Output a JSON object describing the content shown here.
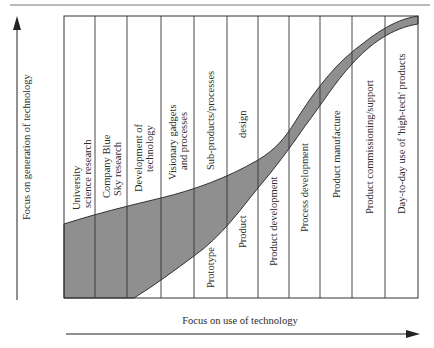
{
  "diagram": {
    "type": "technology-focus-band",
    "y_axis_label": "Focus on generation of technology",
    "x_axis_label": "Focus on use of technology",
    "band_color": "#8f8f8f",
    "frame_color": "#333333",
    "columns": [
      {
        "lines": [
          "University",
          "science research"
        ]
      },
      {
        "lines": [
          "Company Blue",
          "Sky research"
        ]
      },
      {
        "lines": [
          "Development of",
          "technology"
        ]
      },
      {
        "lines": [
          "Visionary gadgets",
          "and processes"
        ]
      },
      {
        "lines": [
          "Sub-products/processes"
        ]
      },
      {
        "lines": [
          "design"
        ]
      },
      {
        "lines": [
          "Product development"
        ]
      },
      {
        "lines": [
          "Process development"
        ]
      },
      {
        "lines": [
          "Product manufacture"
        ]
      },
      {
        "lines": [
          "Product commissioning/support"
        ]
      },
      {
        "lines": [
          "Day-to-day use of 'high-tech' products"
        ]
      }
    ],
    "lower_labels": [
      {
        "text": "Prototype",
        "column": 4
      },
      {
        "text": "Product",
        "column": 5
      }
    ]
  }
}
